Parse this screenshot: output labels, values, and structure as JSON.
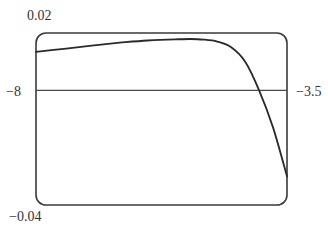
{
  "chart_data": {
    "type": "line",
    "title": "",
    "xlabel": "",
    "ylabel": "",
    "xlim": [
      -8,
      -3.5
    ],
    "ylim": [
      -0.04,
      0.02
    ],
    "grid": false,
    "legend": null,
    "frame": "rounded-rectangle viewing window",
    "axis_line": {
      "orientation": "horizontal",
      "y": 0
    },
    "tick_labels": {
      "y_top": "0.02",
      "y_bottom": "−0.04",
      "x_left": "−8",
      "x_right": "−3.5"
    },
    "series": [
      {
        "name": "f(x)",
        "x": [
          -8.0,
          -7.5,
          -7.0,
          -6.5,
          -6.0,
          -5.5,
          -5.24,
          -5.0,
          -4.75,
          -4.5,
          -4.25,
          -4.0,
          -3.75,
          -3.5
        ],
        "y": [
          0.0134,
          0.0145,
          0.0156,
          0.0166,
          0.0174,
          0.0178,
          0.0179,
          0.0177,
          0.017,
          0.015,
          0.01,
          0.0,
          -0.013,
          -0.03
        ]
      }
    ]
  },
  "labels": {
    "y_top": "0.02",
    "y_bottom": "−0.04",
    "x_left": "−8",
    "x_right": "−3.5"
  },
  "colors": {
    "frame": "#3a3a3a",
    "axis": "#4a4a4a",
    "curve": "#2a2a2a"
  }
}
